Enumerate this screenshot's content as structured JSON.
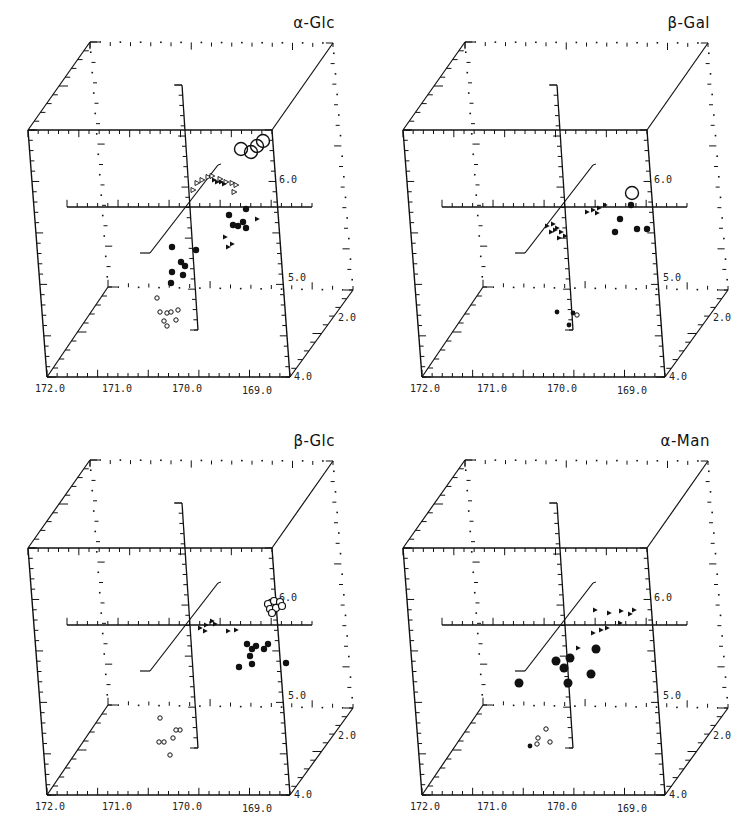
{
  "figure": {
    "panels": [
      {
        "id": "alpha-glc",
        "title": "α-Glc"
      },
      {
        "id": "beta-gal",
        "title": "β-Gal"
      },
      {
        "id": "beta-glc",
        "title": "β-Glc"
      },
      {
        "id": "alpha-man",
        "title": "α-Man"
      }
    ],
    "axis_labels": {
      "x_ticks": [
        "172.0",
        "171.0",
        "170.0",
        "169.0"
      ],
      "y_ticks": [
        "6.0",
        "5.0"
      ],
      "z_ticks": [
        "2.0",
        "4.0"
      ]
    }
  },
  "chart_data": [
    {
      "type": "scatter",
      "title": "α-Glc",
      "projection": "3d-cube",
      "xlabel": "",
      "ylabel": "",
      "zlabel": "",
      "x_ticks": [
        "172.0",
        "171.0",
        "170.0",
        "169.0"
      ],
      "y_ticks": [
        "5.0",
        "6.0"
      ],
      "z_ticks": [
        "2.0",
        "4.0"
      ],
      "grid": false,
      "series": [
        {
          "name": "large open circles",
          "marker": "open-circle-large",
          "points_px": [
            [
              241,
              149
            ],
            [
              251,
              152
            ],
            [
              257,
              146
            ],
            [
              263,
              141
            ]
          ]
        },
        {
          "name": "open triangles",
          "marker": "open-triangle",
          "points_px": [
            [
              193,
              190
            ],
            [
              197,
              183
            ],
            [
              202,
              180
            ],
            [
              208,
              177
            ],
            [
              212,
              176
            ],
            [
              220,
              179
            ],
            [
              226,
              182
            ],
            [
              232,
              183
            ],
            [
              236,
              185
            ],
            [
              234,
              192
            ]
          ]
        },
        {
          "name": "filled small",
          "marker": "filled-triangle",
          "points_px": [
            [
              214,
              180
            ],
            [
              217,
              182
            ],
            [
              221,
              182
            ],
            [
              224,
              184
            ],
            [
              257,
              219
            ],
            [
              225,
              237
            ],
            [
              232,
              244
            ],
            [
              228,
              247
            ]
          ]
        },
        {
          "name": "filled circles (right)",
          "marker": "filled-circle",
          "points_px": [
            [
              229,
              215
            ],
            [
              246,
              209
            ],
            [
              233,
              225
            ],
            [
              238,
              226
            ],
            [
              243,
              222
            ],
            [
              246,
              228
            ]
          ]
        },
        {
          "name": "filled circles (left)",
          "marker": "filled-circle",
          "points_px": [
            [
              172,
              247
            ],
            [
              196,
              250
            ],
            [
              181,
              262
            ],
            [
              185,
              266
            ],
            [
              172,
              272
            ],
            [
              183,
              275
            ],
            [
              171,
              283
            ]
          ]
        },
        {
          "name": "open small",
          "marker": "open-circle-small",
          "points_px": [
            [
              157,
              298
            ],
            [
              160,
              312
            ],
            [
              167,
              313
            ],
            [
              171,
              312
            ],
            [
              178,
              310
            ],
            [
              164,
              321
            ],
            [
              176,
              320
            ],
            [
              167,
              326
            ]
          ]
        }
      ]
    },
    {
      "type": "scatter",
      "title": "β-Gal",
      "projection": "3d-cube",
      "x_ticks": [
        "172.0",
        "171.0",
        "170.0",
        "169.0"
      ],
      "y_ticks": [
        "5.0",
        "6.0"
      ],
      "z_ticks": [
        "2.0",
        "4.0"
      ],
      "series": [
        {
          "name": "large open circle",
          "marker": "open-circle-large",
          "points_px": [
            [
              257,
              193
            ]
          ]
        },
        {
          "name": "filled circles",
          "marker": "filled-circle",
          "points_px": [
            [
              256,
              205
            ],
            [
              245,
              219
            ],
            [
              240,
              232
            ],
            [
              262,
              229
            ],
            [
              272,
              229
            ]
          ]
        },
        {
          "name": "filled small",
          "marker": "filled-triangle",
          "points_px": [
            [
              212,
              212
            ],
            [
              218,
              210
            ],
            [
              224,
              208
            ],
            [
              230,
              205
            ],
            [
              222,
              213
            ]
          ]
        },
        {
          "name": "triangle cluster",
          "marker": "filled-triangle",
          "points_px": [
            [
              172,
              226
            ],
            [
              178,
              224
            ],
            [
              182,
              228
            ],
            [
              176,
              232
            ],
            [
              186,
              232
            ],
            [
              184,
              238
            ],
            [
              190,
              236
            ],
            [
              180,
              230
            ]
          ]
        },
        {
          "name": "bottom cluster",
          "marker": "filled-circle-small",
          "points_px": [
            [
              182,
              312
            ],
            [
              194,
              325
            ],
            [
              198,
              313
            ]
          ]
        },
        {
          "name": "open small",
          "marker": "open-circle-small",
          "points_px": [
            [
              202,
              315
            ]
          ]
        }
      ]
    },
    {
      "type": "scatter",
      "title": "β-Glc",
      "projection": "3d-cube",
      "x_ticks": [
        "172.0",
        "171.0",
        "170.0",
        "169.0"
      ],
      "y_ticks": [
        "5.0",
        "6.0"
      ],
      "z_ticks": [
        "2.0",
        "4.0"
      ],
      "series": [
        {
          "name": "open circles cluster",
          "marker": "open-circle",
          "points_px": [
            [
              268,
              186
            ],
            [
              274,
              183
            ],
            [
              280,
              184
            ],
            [
              270,
              191
            ],
            [
              276,
              190
            ],
            [
              282,
              188
            ],
            [
              272,
              195
            ]
          ]
        },
        {
          "name": "filled small crosses",
          "marker": "filled-triangle",
          "points_px": [
            [
              200,
              210
            ],
            [
              206,
              207
            ],
            [
              212,
              203
            ],
            [
              205,
              213
            ],
            [
              215,
              206
            ],
            [
              228,
              213
            ],
            [
              236,
              212
            ]
          ]
        },
        {
          "name": "filled circles",
          "marker": "filled-circle",
          "points_px": [
            [
              247,
              226
            ],
            [
              252,
              231
            ],
            [
              256,
              228
            ],
            [
              264,
              231
            ],
            [
              268,
              226
            ],
            [
              250,
              238
            ],
            [
              239,
              249
            ],
            [
              252,
              246
            ],
            [
              286,
              245
            ]
          ]
        },
        {
          "name": "open small",
          "marker": "open-circle-small",
          "points_px": [
            [
              160,
              300
            ],
            [
              180,
              312
            ],
            [
              176,
              312
            ],
            [
              173,
              320
            ],
            [
              159,
              324
            ],
            [
              164,
              324
            ],
            [
              170,
              337
            ]
          ]
        }
      ]
    },
    {
      "type": "scatter",
      "title": "α-Man",
      "projection": "3d-cube",
      "x_ticks": [
        "172.0",
        "171.0",
        "170.0",
        "169.0"
      ],
      "y_ticks": [
        "5.0",
        "6.0"
      ],
      "z_ticks": [
        "2.0",
        "4.0"
      ],
      "series": [
        {
          "name": "large filled circles",
          "marker": "filled-circle-large",
          "points_px": [
            [
              144,
              265
            ],
            [
              181,
              243
            ],
            [
              195,
              240
            ],
            [
              189,
              250
            ],
            [
              193,
              265
            ],
            [
              216,
              256
            ],
            [
              221,
              231
            ]
          ]
        },
        {
          "name": "small filled triangles",
          "marker": "filled-triangle",
          "points_px": [
            [
              220,
              192
            ],
            [
              234,
              195
            ],
            [
              246,
              193
            ],
            [
              255,
              196
            ],
            [
              259,
              192
            ],
            [
              245,
              205
            ],
            [
              232,
              210
            ],
            [
              226,
              212
            ],
            [
              218,
              215
            ],
            [
              203,
              230
            ]
          ]
        },
        {
          "name": "open small",
          "marker": "open-circle-small",
          "points_px": [
            [
              171,
              311
            ],
            [
              163,
              320
            ],
            [
              162,
              326
            ],
            [
              175,
              324
            ]
          ]
        },
        {
          "name": "filled small",
          "marker": "filled-circle-small",
          "points_px": [
            [
              155,
              328
            ]
          ]
        }
      ]
    }
  ]
}
